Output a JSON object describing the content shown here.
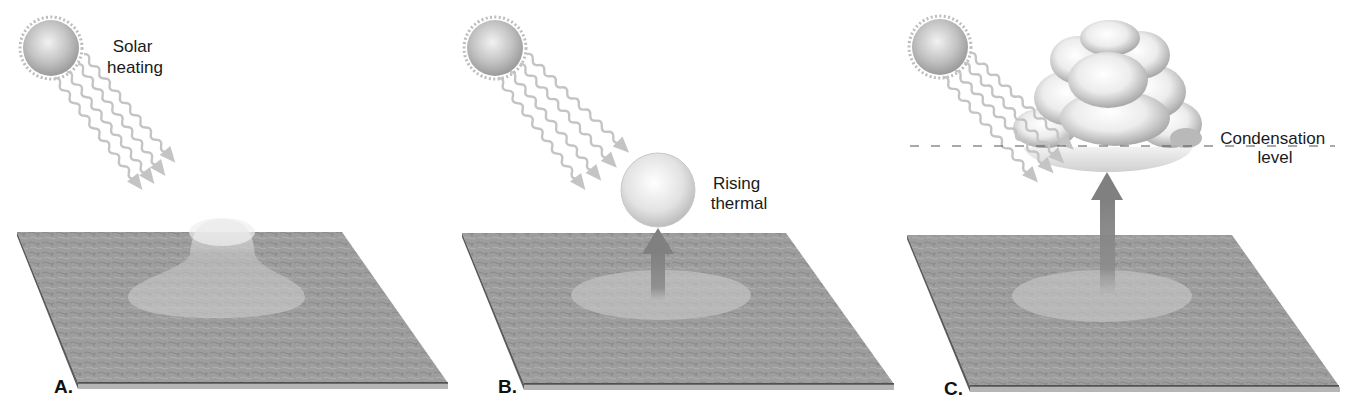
{
  "diagram": {
    "colors": {
      "background": "#ffffff",
      "ground": "#9c9c9c",
      "ground_edge_dark": "#3a3a3a",
      "ground_edge_light": "#b5b5b5",
      "ray": "#c4c4c4",
      "sun": "#bdbdbd",
      "bubble": "#e6e6e6",
      "arrow": "#8a8a8a",
      "dash": "#555555",
      "text": "#1a1a1a"
    },
    "panels": [
      {
        "id": "A",
        "letter": "A.",
        "label_lines": [
          "Solar",
          "heating"
        ],
        "feature": "warm-air-bell"
      },
      {
        "id": "B",
        "letter": "B.",
        "label_lines": [
          "Rising",
          "thermal"
        ],
        "feature": "rising-thermal-bubble"
      },
      {
        "id": "C",
        "letter": "C.",
        "label_lines": [
          "Condensation",
          "level"
        ],
        "feature": "cumulus-cloud"
      }
    ]
  }
}
